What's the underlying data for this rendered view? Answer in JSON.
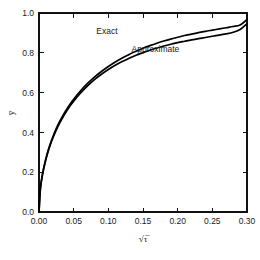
{
  "chart_data": {
    "type": "line",
    "title": "",
    "subtitle": "",
    "xlabel": "√τ̅",
    "ylabel": "y̅",
    "xlim": [
      0.0,
      0.3
    ],
    "ylim": [
      0.0,
      1.0
    ],
    "grid": false,
    "legend_position": "inline-annotations",
    "frame": "box",
    "tick_direction": "in",
    "x_ticks": [
      0.0,
      0.05,
      0.1,
      0.15,
      0.2,
      0.25,
      0.3
    ],
    "x_tick_labels": [
      "0.00",
      "0.05",
      "0.10",
      "0.15",
      "0.20",
      "0.25",
      "0.30"
    ],
    "y_ticks": [
      0.0,
      0.2,
      0.4,
      0.6,
      0.8,
      1.0
    ],
    "y_tick_labels": [
      "0.0",
      "0.2",
      "0.4",
      "0.6",
      "0.8",
      "1.0"
    ],
    "series": [
      {
        "name": "Exact",
        "color": "#000000",
        "x": [
          0.0,
          0.002,
          0.005,
          0.008,
          0.012,
          0.016,
          0.02,
          0.025,
          0.03,
          0.035,
          0.04,
          0.045,
          0.05,
          0.06,
          0.07,
          0.08,
          0.09,
          0.1,
          0.11,
          0.12,
          0.13,
          0.14,
          0.15,
          0.16,
          0.17,
          0.18,
          0.19,
          0.2,
          0.21,
          0.22,
          0.23,
          0.24,
          0.25,
          0.26,
          0.27,
          0.28,
          0.29,
          0.3
        ],
        "y": [
          0.0,
          0.118,
          0.19,
          0.24,
          0.295,
          0.34,
          0.378,
          0.42,
          0.456,
          0.488,
          0.517,
          0.543,
          0.567,
          0.609,
          0.646,
          0.678,
          0.706,
          0.731,
          0.754,
          0.774,
          0.792,
          0.808,
          0.823,
          0.836,
          0.848,
          0.859,
          0.869,
          0.878,
          0.887,
          0.894,
          0.901,
          0.908,
          0.914,
          0.92,
          0.926,
          0.932,
          0.94,
          0.968
        ]
      },
      {
        "name": "Approximate",
        "color": "#000000",
        "x": [
          0.0,
          0.002,
          0.005,
          0.008,
          0.012,
          0.016,
          0.02,
          0.025,
          0.03,
          0.035,
          0.04,
          0.045,
          0.05,
          0.06,
          0.07,
          0.08,
          0.09,
          0.1,
          0.11,
          0.12,
          0.13,
          0.14,
          0.15,
          0.16,
          0.17,
          0.18,
          0.19,
          0.2,
          0.21,
          0.22,
          0.23,
          0.24,
          0.25,
          0.26,
          0.27,
          0.28,
          0.29,
          0.3
        ],
        "y": [
          0.0,
          0.116,
          0.187,
          0.236,
          0.29,
          0.334,
          0.372,
          0.413,
          0.448,
          0.48,
          0.508,
          0.534,
          0.557,
          0.598,
          0.634,
          0.665,
          0.692,
          0.716,
          0.737,
          0.756,
          0.773,
          0.788,
          0.801,
          0.813,
          0.824,
          0.834,
          0.843,
          0.851,
          0.858,
          0.865,
          0.871,
          0.877,
          0.883,
          0.889,
          0.895,
          0.903,
          0.917,
          0.947
        ]
      }
    ],
    "annotations": [
      {
        "text": "Exact",
        "x": 0.098,
        "y": 0.895
      },
      {
        "text": "Approximate",
        "x": 0.168,
        "y": 0.805
      }
    ]
  }
}
